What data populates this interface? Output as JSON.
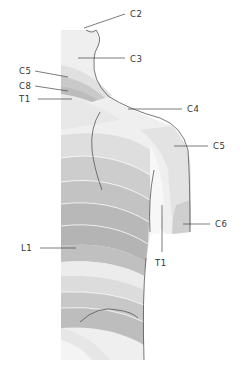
{
  "figure": {
    "labels": [
      {
        "id": "c2",
        "text": "C2"
      },
      {
        "id": "c3",
        "text": "C3"
      },
      {
        "id": "c5_left",
        "text": "C5"
      },
      {
        "id": "c8",
        "text": "C8"
      },
      {
        "id": "t1_left",
        "text": "T1"
      },
      {
        "id": "c4",
        "text": "C4"
      },
      {
        "id": "c5_right",
        "text": "C5"
      },
      {
        "id": "c6",
        "text": "C6"
      },
      {
        "id": "t1_arm",
        "text": "T1"
      },
      {
        "id": "l1",
        "text": "L1"
      }
    ]
  },
  "colors": {
    "lightest": "#f2f2f2",
    "light": "#e4e4e4",
    "mid": "#cfcfcf",
    "dark": "#b9b9b9",
    "outline": "#555555"
  }
}
